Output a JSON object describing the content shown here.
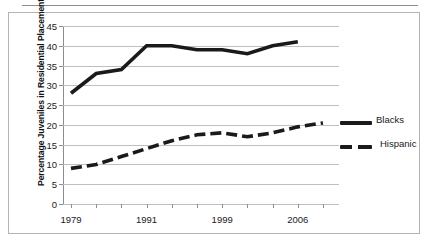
{
  "figure": {
    "top_fragment_left": "·",
    "top_fragment_right": "·"
  },
  "legend": {
    "position": "right",
    "items": [
      {
        "label": "Blacks",
        "style": "solid",
        "color": "#1a1a1a"
      },
      {
        "label": "Hispanic",
        "style": "dashed",
        "color": "#1a1a1a"
      }
    ]
  },
  "axis": {
    "y_title": "Percentage Juveniles in Residential Placement",
    "y_ticks": [
      "45",
      "40",
      "35",
      "30",
      "25",
      "20",
      "15",
      "10",
      "5",
      "0"
    ],
    "x_ticks": [
      "1979",
      "1991",
      "1999",
      "2006"
    ]
  },
  "chart_data": {
    "type": "line",
    "title": "",
    "xlabel": "",
    "ylabel": "Percentage Juveniles in Residential Placement",
    "ylim": [
      0,
      45
    ],
    "ytick_values": [
      0,
      5,
      10,
      15,
      20,
      25,
      30,
      35,
      40,
      45
    ],
    "grid": true,
    "legend_position": "right",
    "x_labeled_ticks": [
      "1979",
      "1991",
      "1999",
      "2006"
    ],
    "x_index": [
      0,
      1,
      2,
      3,
      4,
      5,
      6,
      7,
      8,
      9,
      10
    ],
    "series": [
      {
        "name": "Blacks",
        "style": "solid",
        "color": "#1a1a1a",
        "values": [
          28,
          33,
          34,
          40,
          40,
          39,
          39,
          38,
          40,
          41
        ]
      },
      {
        "name": "Hispanic",
        "style": "dashed",
        "color": "#1a1a1a",
        "values": [
          9,
          10,
          12,
          14,
          16,
          17.5,
          18,
          17,
          18,
          19.5,
          20.5
        ]
      }
    ]
  }
}
